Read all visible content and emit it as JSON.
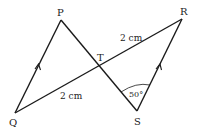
{
  "diagram": {
    "points": {
      "P": {
        "label": "P",
        "x": 61,
        "y": 20
      },
      "Q": {
        "label": "Q",
        "x": 15,
        "y": 113
      },
      "R": {
        "label": "R",
        "x": 182,
        "y": 19
      },
      "S": {
        "label": "S",
        "x": 137,
        "y": 111
      },
      "T": {
        "label": "T",
        "x": 100,
        "y": 67
      }
    },
    "segments": [
      "QP",
      "PS",
      "QR",
      "SR"
    ],
    "parallel_marks": [
      "QP",
      "SR"
    ],
    "measurements": {
      "TR": "2 cm",
      "QT": "2 cm"
    },
    "angle": {
      "vertex": "S",
      "value": "50°"
    },
    "colors": {
      "line": "#1a1a1a",
      "background": "#ffffff"
    }
  }
}
